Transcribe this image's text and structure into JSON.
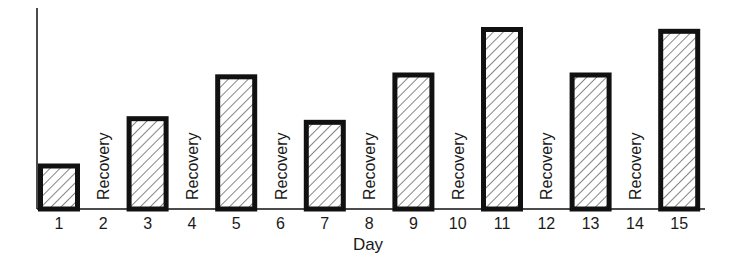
{
  "chart_data": {
    "type": "bar",
    "title": "",
    "xlabel": "Day",
    "ylabel": "",
    "y_axis_ticks": false,
    "grid": false,
    "legend": null,
    "ylim": [
      0,
      10
    ],
    "value_note": "Relative bar heights (no y-axis scale shown); tallest bars = 10",
    "categories": [
      "1",
      "2",
      "3",
      "4",
      "5",
      "6",
      "7",
      "8",
      "9",
      "10",
      "11",
      "12",
      "13",
      "14",
      "15"
    ],
    "values": [
      2.5,
      null,
      5.1,
      null,
      7.4,
      null,
      4.9,
      null,
      7.5,
      null,
      10,
      null,
      7.5,
      null,
      9.9
    ],
    "annotations": [
      {
        "day": "2",
        "text": "Recovery"
      },
      {
        "day": "4",
        "text": "Recovery"
      },
      {
        "day": "6",
        "text": "Recovery"
      },
      {
        "day": "8",
        "text": "Recovery"
      },
      {
        "day": "10",
        "text": "Recovery"
      },
      {
        "day": "12",
        "text": "Recovery"
      },
      {
        "day": "14",
        "text": "Recovery"
      }
    ],
    "bar_style": {
      "fill": "hatched diagonal",
      "stroke": "#111111"
    }
  },
  "colors": {
    "ink": "#111111",
    "background": "#ffffff"
  }
}
